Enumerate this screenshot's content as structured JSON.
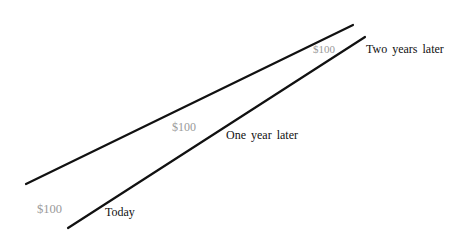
{
  "diagram": {
    "lines": [
      {
        "name": "upper-line",
        "role": "value-line"
      },
      {
        "name": "lower-line",
        "role": "time-line"
      }
    ],
    "money_labels": [
      {
        "text": "$100",
        "color": "#9a9a9a"
      },
      {
        "text": "$100",
        "color": "#9a9a9a"
      },
      {
        "text": "$100",
        "color": "#9a9a9a"
      }
    ],
    "time_labels": [
      {
        "text": "Today"
      },
      {
        "text": "One year later"
      },
      {
        "text": "Two years later"
      }
    ],
    "line_color": "#111111"
  }
}
